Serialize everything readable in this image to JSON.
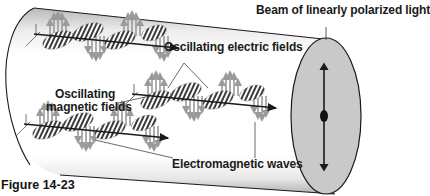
{
  "figure": {
    "caption": "Figure 14-23",
    "labels": {
      "beam": "Beam of linearly polarized light",
      "electric": "Oscillating electric fields",
      "magnetic_line1": "Oscillating",
      "magnetic_line2": "magnetic fields",
      "waves": "Electromagnetic waves"
    },
    "elements": {
      "tube": "cylindrical beam tube",
      "end_face": "elliptical cross-section face",
      "polarization_axis": "vertical double-headed arrow",
      "waves": [
        "upper wave",
        "middle wave",
        "lower wave"
      ]
    },
    "colors": {
      "tube_shadow": "#bdbdbd",
      "face_fill": "#c9c9c9",
      "electric_hatch": "#3a3a3a",
      "magnetic_arrows": "#9a9a9a",
      "ink": "#1a1a1a"
    }
  }
}
